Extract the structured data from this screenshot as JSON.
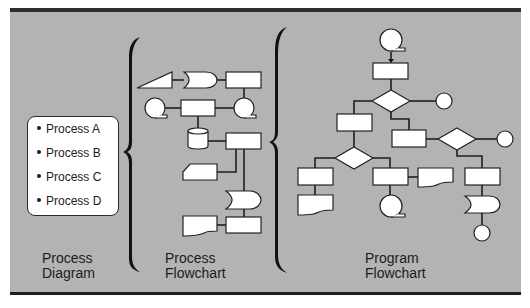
{
  "colors": {
    "panel_background": "#b3b3b3",
    "panel_top_bar": "#2e2e2e",
    "panel_bottom_line": "#1e1e1e",
    "shape_fill": "#ffffff",
    "shape_stroke": "#222222",
    "text": "#1c1c1c"
  },
  "process_diagram": {
    "items": [
      {
        "label": "Process A"
      },
      {
        "label": "Process B"
      },
      {
        "label": "Process C"
      },
      {
        "label": "Process D"
      }
    ],
    "caption_line1": "Process",
    "caption_line2": "Diagram"
  },
  "process_flowchart": {
    "caption_line1": "Process",
    "caption_line2": "Flowchart",
    "symbols": [
      "manual-input",
      "stored-data",
      "process",
      "sequential-tape",
      "process",
      "sequential-tape",
      "magnetic-disk",
      "process",
      "punched-card",
      "stored-data",
      "document",
      "process"
    ]
  },
  "program_flowchart": {
    "caption_line1": "Program",
    "caption_line2": "Flowchart",
    "symbols": [
      "sequential-tape",
      "process",
      "decision",
      "connector",
      "process",
      "process",
      "decision",
      "connector",
      "decision",
      "process",
      "process",
      "document",
      "process",
      "document",
      "sequential-tape",
      "stored-data",
      "connector"
    ]
  }
}
